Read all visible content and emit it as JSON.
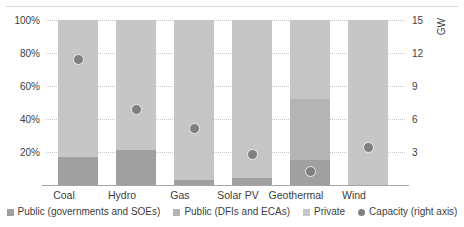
{
  "chart_data": {
    "type": "bar",
    "title": "",
    "subtitle": "",
    "xlabel": "",
    "ylabel": "",
    "ylabel_right": "GW",
    "categories": [
      "Coal",
      "Hydro",
      "Gas",
      "Solar PV",
      "Geothermal",
      "Wind"
    ],
    "series": [
      {
        "name": "Public (governments and SOEs)",
        "color": "#a0a0a0",
        "values": [
          17,
          21,
          3,
          4,
          15,
          0
        ]
      },
      {
        "name": "Public (DFIs and ECAs)",
        "color": "#b4b4b4",
        "values": [
          0,
          0,
          0,
          0,
          37,
          0
        ]
      },
      {
        "name": "Private",
        "color": "#c6c6c6",
        "values": [
          83,
          79,
          97,
          96,
          48,
          100
        ]
      }
    ],
    "overlay": {
      "name": "Capacity (right axis)",
      "color": "#808080",
      "axis": "right",
      "unit": "GW",
      "values": [
        11.4,
        6.9,
        5.1,
        2.8,
        1.2,
        3.4
      ]
    },
    "ylim": [
      0,
      100
    ],
    "yticks": [
      "20%",
      "40%",
      "60%",
      "80%",
      "100%"
    ],
    "ylim_right": [
      0,
      15
    ],
    "yticks_right": [
      "3",
      "6",
      "9",
      "12",
      "15"
    ],
    "grid": true,
    "legend_position": "bottom",
    "stacked": true,
    "stack_total_percent": 100
  },
  "legend": {
    "items": [
      {
        "label": "Public (governments and SOEs)",
        "marker": "square-swatch"
      },
      {
        "label": "Public (DFIs and ECAs)",
        "marker": "square-swatch"
      },
      {
        "label": "Private",
        "marker": "square-swatch"
      },
      {
        "label": "Capacity (right axis)",
        "marker": "circle-marker"
      }
    ]
  }
}
